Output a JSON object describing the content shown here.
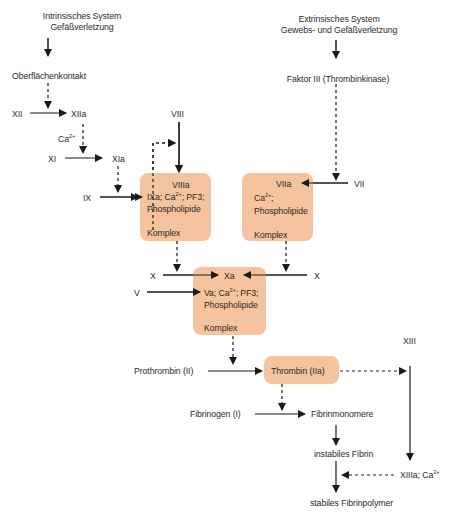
{
  "colors": {
    "box_fill": "#f5c49e",
    "line": "#1a1a1a",
    "text": "#2b2b2b"
  },
  "intrinsic": {
    "title_line1": "Intrinsisches System",
    "title_line2": "Gefäßverletzung",
    "contact": "Oberflächenkontakt",
    "xii": "XII",
    "xiia": "XIIa",
    "ca": "Ca",
    "ca_sup": "2+",
    "xi": "XI",
    "xia": "XIa",
    "ix": "IX",
    "viii": "VIII"
  },
  "extrinsic": {
    "title_line1": "Extrinsisches System",
    "title_line2": "Gewebs- und Gefäßverletzung",
    "factor3": "Faktor III (Thrombinkinase)",
    "vii": "VII"
  },
  "box_intrinsic": {
    "head": "VIIIa",
    "line1_pre": "IXa; Ca",
    "line1_sup": "2+",
    "line1_post": "; PF3;",
    "line2": "Phospholipide",
    "footer": "Komplex"
  },
  "box_extrinsic": {
    "head": "VIIa",
    "line1_pre": "Ca",
    "line1_sup": "2+",
    "line1_post": ";",
    "line2": "Phospholipide",
    "footer": "Komplex"
  },
  "box_common": {
    "head": "Xa",
    "line1_pre": "Va; Ca",
    "line1_sup": "2+",
    "line1_post": "; PF3;",
    "line2": "Phospholipide",
    "footer": "Komplex"
  },
  "common": {
    "x_left": "X",
    "x_right": "X",
    "v": "V",
    "prothrombin": "Prothrombin (II)",
    "thrombin": "Thrombin (IIa)",
    "fibrinogen": "Fibrinogen (I)",
    "fibrinmonomere": "Fibrinmonomere",
    "instabiles": "instabiles Fibrin",
    "xiii": "XIII",
    "xiiia_pre": "XIIIa; Ca",
    "xiiia_sup": "2+",
    "stabiles": "stabiles Fibrinpolymer"
  }
}
